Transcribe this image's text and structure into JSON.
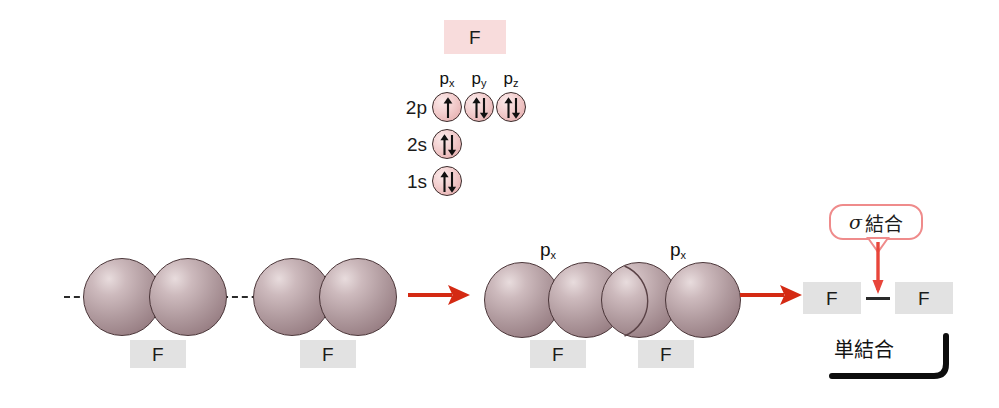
{
  "figure": {
    "title_chip": "F",
    "background": "#ffffff"
  },
  "orbital_diagram": {
    "element_label": "F",
    "subshell_headers": [
      "p",
      "p",
      "p"
    ],
    "subshell_header_subs": [
      "x",
      "y",
      "z"
    ],
    "rows": [
      {
        "label": "2p",
        "orbitals": [
          {
            "name": "px",
            "electrons": "up"
          },
          {
            "name": "py",
            "electrons": "up-down"
          },
          {
            "name": "pz",
            "electrons": "up-down"
          }
        ]
      },
      {
        "label": "2s",
        "orbitals": [
          {
            "name": "2s",
            "electrons": "up-down"
          }
        ]
      },
      {
        "label": "1s",
        "orbitals": [
          {
            "name": "1s",
            "electrons": "up-down"
          }
        ]
      }
    ]
  },
  "stage_left": {
    "atom_a_label": "F",
    "atom_b_label": "F",
    "axis_style": "dashed"
  },
  "stage_middle": {
    "orbital_label_left": "p",
    "orbital_label_left_sub": "x",
    "orbital_label_right": "p",
    "orbital_label_right_sub": "x",
    "atom_a_label": "F",
    "atom_b_label": "F",
    "overlap_color": "#f0b2ad"
  },
  "stage_right": {
    "callout_sigma": "σ",
    "callout_text": "結合",
    "atom_a_label": "F",
    "bond_symbol": "—",
    "atom_b_label": "F",
    "bracket_caption": "単結合"
  },
  "arrows": {
    "arrow_1": "→",
    "arrow_2": "→",
    "color": "#d42a13"
  },
  "colors": {
    "chip_pink": "#f8dcdc",
    "chip_gray": "#e2e2e2",
    "sphere": "#a89296",
    "overlap_pink": "#f0b2ad",
    "callout_border": "#ef8b8b",
    "arrow_red": "#d42a13",
    "ink": "#1b1b1b"
  }
}
